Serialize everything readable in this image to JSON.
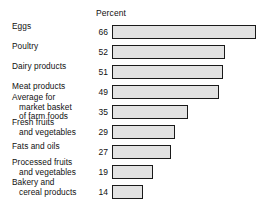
{
  "chart_data": {
    "type": "bar",
    "orientation": "horizontal",
    "title": "",
    "xlabel": "Percent",
    "ylabel": "",
    "axis_header": "Percent",
    "grid": false,
    "legend": false,
    "xlim": [
      0,
      66
    ],
    "categories": [
      "Eggs",
      "Poultry",
      "Dairy products",
      "Meat products",
      "Average for market basket of farm foods",
      "Fresh fruits and vegetables",
      "Fats and oils",
      "Processed fruits and vegetables",
      "Bakery and cereal products"
    ],
    "values": [
      66,
      52,
      51,
      49,
      35,
      29,
      27,
      19,
      14
    ],
    "value_labels": [
      "66",
      "52",
      "51",
      "49",
      "35",
      "29",
      "27",
      "19",
      "14"
    ],
    "bar_fill": "#e2e2e2",
    "bar_border": "#1a1a1a"
  },
  "rows": [
    {
      "lines": [
        "Eggs"
      ],
      "value_label": "66",
      "bar_width_px": "144px"
    },
    {
      "lines": [
        "Poultry"
      ],
      "value_label": "52",
      "bar_width_px": "113px"
    },
    {
      "lines": [
        "Dairy products"
      ],
      "value_label": "51",
      "bar_width_px": "111px"
    },
    {
      "lines": [
        "Meat products"
      ],
      "value_label": "49",
      "bar_width_px": "107px"
    },
    {
      "lines": [
        "Average for",
        "market basket",
        "of farm foods"
      ],
      "value_label": "35",
      "bar_width_px": "76px"
    },
    {
      "lines": [
        "Fresh fruits",
        "and vegetables"
      ],
      "value_label": "29",
      "bar_width_px": "63px"
    },
    {
      "lines": [
        "Fats and oils"
      ],
      "value_label": "27",
      "bar_width_px": "59px"
    },
    {
      "lines": [
        "Processed fruits",
        "and vegetables"
      ],
      "value_label": "19",
      "bar_width_px": "41px"
    },
    {
      "lines": [
        "Bakery and",
        "cereal products"
      ],
      "value_label": "14",
      "bar_width_px": "31px"
    }
  ]
}
